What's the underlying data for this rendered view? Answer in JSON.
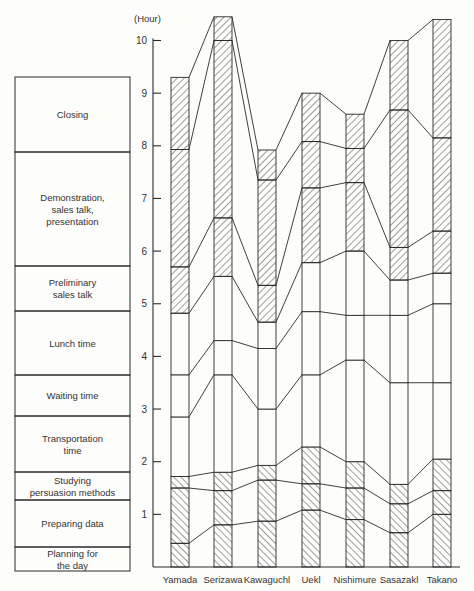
{
  "chart_data": {
    "type": "bar",
    "subtype": "stacked-connected",
    "title": "",
    "ylabel": "(Hour)",
    "xlabel": "",
    "ylim": [
      0,
      10.5
    ],
    "yticks": [
      1,
      2,
      3,
      4,
      5,
      6,
      7,
      8,
      9,
      10
    ],
    "grid": false,
    "legend_position": "left (stacked label boxes)",
    "categories": [
      "Yamada",
      "Serizawa",
      "Kawaguchl",
      "Uekl",
      "Nishimure",
      "Sasazakl",
      "Takano"
    ],
    "series": [
      {
        "name": "Planning for the day",
        "hatch": "back",
        "cumulative_top": [
          0.45,
          0.8,
          0.87,
          1.08,
          0.9,
          0.65,
          1.0
        ],
        "values": [
          0.45,
          0.8,
          0.87,
          1.08,
          0.9,
          0.65,
          1.0
        ]
      },
      {
        "name": "Preparing data",
        "hatch": "back",
        "cumulative_top": [
          1.5,
          1.45,
          1.65,
          1.58,
          1.5,
          1.2,
          1.45
        ],
        "values": [
          1.05,
          0.65,
          0.78,
          0.5,
          0.6,
          0.55,
          0.45
        ]
      },
      {
        "name": "Studying persuasion methods",
        "hatch": "back",
        "cumulative_top": [
          1.72,
          1.8,
          1.93,
          2.28,
          2.0,
          1.57,
          2.05
        ],
        "values": [
          0.22,
          0.35,
          0.28,
          0.7,
          0.5,
          0.37,
          0.6
        ]
      },
      {
        "name": "Transportation time",
        "hatch": "none",
        "cumulative_top": [
          2.85,
          3.65,
          3.0,
          3.65,
          3.93,
          3.5,
          3.5
        ],
        "values": [
          1.13,
          1.85,
          1.07,
          1.37,
          1.93,
          1.93,
          1.45
        ]
      },
      {
        "name": "Waiting time",
        "hatch": "none",
        "cumulative_top": [
          3.65,
          4.3,
          4.15,
          4.85,
          4.78,
          4.78,
          5.0
        ],
        "values": [
          0.8,
          0.65,
          1.15,
          1.2,
          0.85,
          1.28,
          1.5
        ]
      },
      {
        "name": "Lunch time",
        "hatch": "none",
        "cumulative_top": [
          4.82,
          5.52,
          4.65,
          5.78,
          6.0,
          5.45,
          5.58
        ],
        "values": [
          1.17,
          1.22,
          0.5,
          0.93,
          1.22,
          0.67,
          0.58
        ]
      },
      {
        "name": "Preliminary sales talk",
        "hatch": "fwd",
        "cumulative_top": [
          5.7,
          6.63,
          5.35,
          7.2,
          7.3,
          6.07,
          6.38
        ],
        "values": [
          0.88,
          1.11,
          0.7,
          1.42,
          1.3,
          0.62,
          0.8
        ]
      },
      {
        "name": "Demonstration, sales talk, presentation",
        "hatch": "fwd",
        "cumulative_top": [
          7.93,
          10.0,
          7.35,
          8.08,
          7.95,
          8.68,
          8.15
        ],
        "values": [
          2.23,
          3.37,
          2.0,
          0.88,
          0.65,
          2.61,
          1.77
        ]
      },
      {
        "name": "Closing",
        "hatch": "fwd",
        "cumulative_top": [
          9.3,
          10.45,
          7.92,
          9.0,
          8.6,
          10.0,
          10.4
        ],
        "values": [
          1.37,
          0.45,
          0.57,
          0.92,
          0.65,
          1.32,
          2.25
        ]
      }
    ]
  },
  "legend_boxes": [
    {
      "lines": [
        "Closing"
      ]
    },
    {
      "lines": [
        "Demonstration,",
        "sales talk,",
        "presentation"
      ]
    },
    {
      "lines": [
        "Preliminary",
        "sales talk"
      ]
    },
    {
      "lines": [
        "Lunch time"
      ]
    },
    {
      "lines": [
        "Waiting time"
      ]
    },
    {
      "lines": [
        "Transportation",
        "time"
      ]
    },
    {
      "lines": [
        "Studying",
        "persuasion methods"
      ]
    },
    {
      "lines": [
        "Preparing data"
      ]
    },
    {
      "lines": [
        "Planning for",
        "the day"
      ]
    }
  ],
  "axis": {
    "unit_label": "(Hour)",
    "tick_labels": [
      "1",
      "2",
      "3",
      "4",
      "5",
      "6",
      "7",
      "8",
      "9",
      "10"
    ]
  },
  "colors": {
    "ink": "#2a2a2a",
    "paper": "#fdfdfb"
  }
}
